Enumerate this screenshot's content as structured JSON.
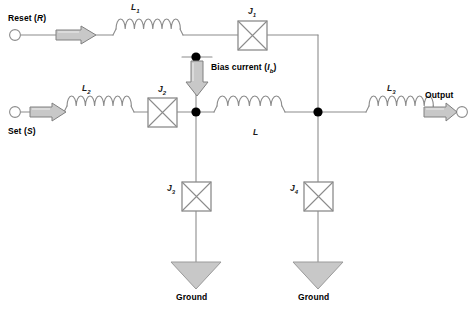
{
  "diagram": {
    "background_color": "#ffffff",
    "wire_color": "#8c8c8c",
    "node_color": "#000000",
    "arrow_fill": "#c8c8c8",
    "arrow_stroke": "#808080",
    "junction_fill": "#ffffff",
    "junction_stroke": "#8c8c8c"
  },
  "terminals": {
    "reset": {
      "label_prefix": "Reset (",
      "label_var": "R",
      "label_suffix": ")",
      "full": "Reset (R)"
    },
    "set": {
      "label_prefix": "Set (",
      "label_var": "S",
      "label_suffix": ")",
      "full": "Set (S)"
    },
    "output": {
      "label": "Output"
    }
  },
  "inductors": [
    {
      "id": "L1",
      "name": "L",
      "sub": "1",
      "turns": 7
    },
    {
      "id": "L2",
      "name": "L",
      "sub": "2",
      "turns": 7
    },
    {
      "id": "L",
      "name": "L",
      "sub": "",
      "turns": 6
    },
    {
      "id": "L3",
      "name": "L",
      "sub": "3",
      "turns": 7
    }
  ],
  "junctions": [
    {
      "id": "J1",
      "name": "J",
      "sub": "1"
    },
    {
      "id": "J2",
      "name": "J",
      "sub": "2"
    },
    {
      "id": "J3",
      "name": "J",
      "sub": "3"
    },
    {
      "id": "J4",
      "name": "J",
      "sub": "4"
    }
  ],
  "bias": {
    "label_prefix": "Bias current (",
    "label_var": "I",
    "label_var_sub": "b",
    "label_suffix": ")",
    "full": "Bias current (Ib)",
    "direction": "down"
  },
  "grounds": [
    {
      "id": "ground-left",
      "label": "Ground"
    },
    {
      "id": "ground-right",
      "label": "Ground"
    }
  ]
}
